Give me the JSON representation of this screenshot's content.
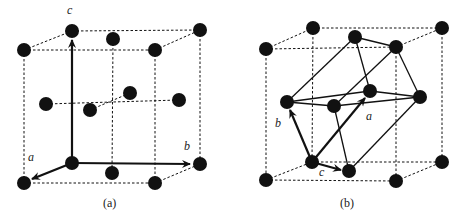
{
  "figure_a": {
    "caption": "(a)",
    "axis_labels": {
      "a": "a",
      "b": "b",
      "c": "c"
    },
    "description": "Face-centered cubic conventional cell with lattice vectors a, b, c"
  },
  "figure_b": {
    "caption": "(b)",
    "axis_labels": {
      "a": "a",
      "b": "b",
      "c": "c"
    },
    "description": "FCC lattice with primitive rhombohedral cell outlined in solid lines"
  },
  "colors": {
    "atom": "#111111",
    "line": "#111111",
    "background": "#ffffff"
  }
}
